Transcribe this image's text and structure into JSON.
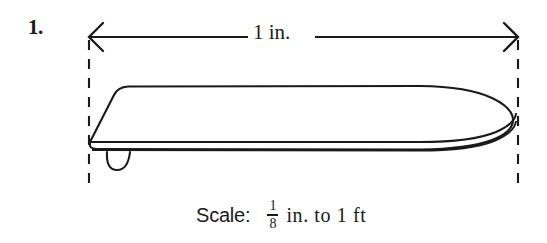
{
  "figure": {
    "problem_number": "1.",
    "dimension_label": "1 in.",
    "object": "ironing-board-side-view",
    "dimension_arrow": {
      "left_arrowhead": true,
      "right_arrowhead": true,
      "extension_lines": "dashed"
    }
  },
  "scale": {
    "word": "Scale:",
    "fraction_numerator": "1",
    "fraction_denominator": "8",
    "tail": "in. to 1 ft",
    "full_text": "Scale: 1/8 in. to 1 ft"
  },
  "colors": {
    "ink": "#1a1a1a",
    "background": "#ffffff"
  }
}
